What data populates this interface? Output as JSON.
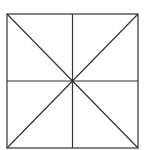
{
  "diagram": {
    "stroke_color": "#333333",
    "background": "#ffffff",
    "square": {
      "x1": 7,
      "y1": 14,
      "x2": 138,
      "y2": 148
    },
    "center": {
      "x": 72.5,
      "y": 81
    },
    "lines": [
      {
        "name": "vertical-midline",
        "x1": 72.5,
        "y1": 14,
        "x2": 72.5,
        "y2": 148
      },
      {
        "name": "horizontal-midline",
        "x1": 7,
        "y1": 81,
        "x2": 138,
        "y2": 81
      },
      {
        "name": "diagonal-tl-br",
        "x1": 7,
        "y1": 14,
        "x2": 138,
        "y2": 148
      },
      {
        "name": "diagonal-tr-bl",
        "x1": 138,
        "y1": 14,
        "x2": 7,
        "y2": 148
      }
    ]
  }
}
